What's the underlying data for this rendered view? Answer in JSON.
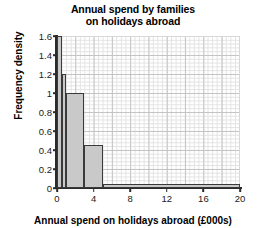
{
  "chart_data": {
    "type": "bar",
    "title": "Annual spend by families on holidays abroad",
    "title_line1": "Annual spend by families",
    "title_line2": "on holidays abroad",
    "xlabel": "Annual spend on holidays abroad (£000s)",
    "ylabel": "Frequency density",
    "xlim": [
      0,
      20
    ],
    "ylim": [
      0,
      1.6
    ],
    "xticks": [
      0,
      4,
      8,
      12,
      16,
      20
    ],
    "xtick_labels": [
      "0",
      "4",
      "8",
      "12",
      "16",
      "20"
    ],
    "yticks": [
      0,
      0.2,
      0.4,
      0.6,
      0.8,
      1,
      1.2,
      1.4,
      1.6
    ],
    "ytick_labels": [
      "0",
      "0.2",
      "0.4",
      "0.6",
      "0.8",
      "1",
      "1.2",
      "1.4",
      "1.6"
    ],
    "grid": true,
    "legend": null,
    "bar_fill": "#c9c9c9",
    "bar_edge": "#3a3a3a",
    "bins": [
      {
        "x0": 0,
        "x1": 0.5,
        "height": 1.6
      },
      {
        "x0": 0.5,
        "x1": 1,
        "height": 1.2
      },
      {
        "x0": 1,
        "x1": 3,
        "height": 1.0
      },
      {
        "x0": 3,
        "x1": 5,
        "height": 0.45
      },
      {
        "x0": 5,
        "x1": 20,
        "height": 0.04
      }
    ],
    "bin_edges": [
      0,
      0.5,
      1,
      3,
      5,
      20
    ],
    "values": [
      1.6,
      1.2,
      1.0,
      0.45,
      0.04
    ],
    "categories": [
      "0-0.5",
      "0.5-1",
      "1-3",
      "3-5",
      "5-20"
    ]
  }
}
